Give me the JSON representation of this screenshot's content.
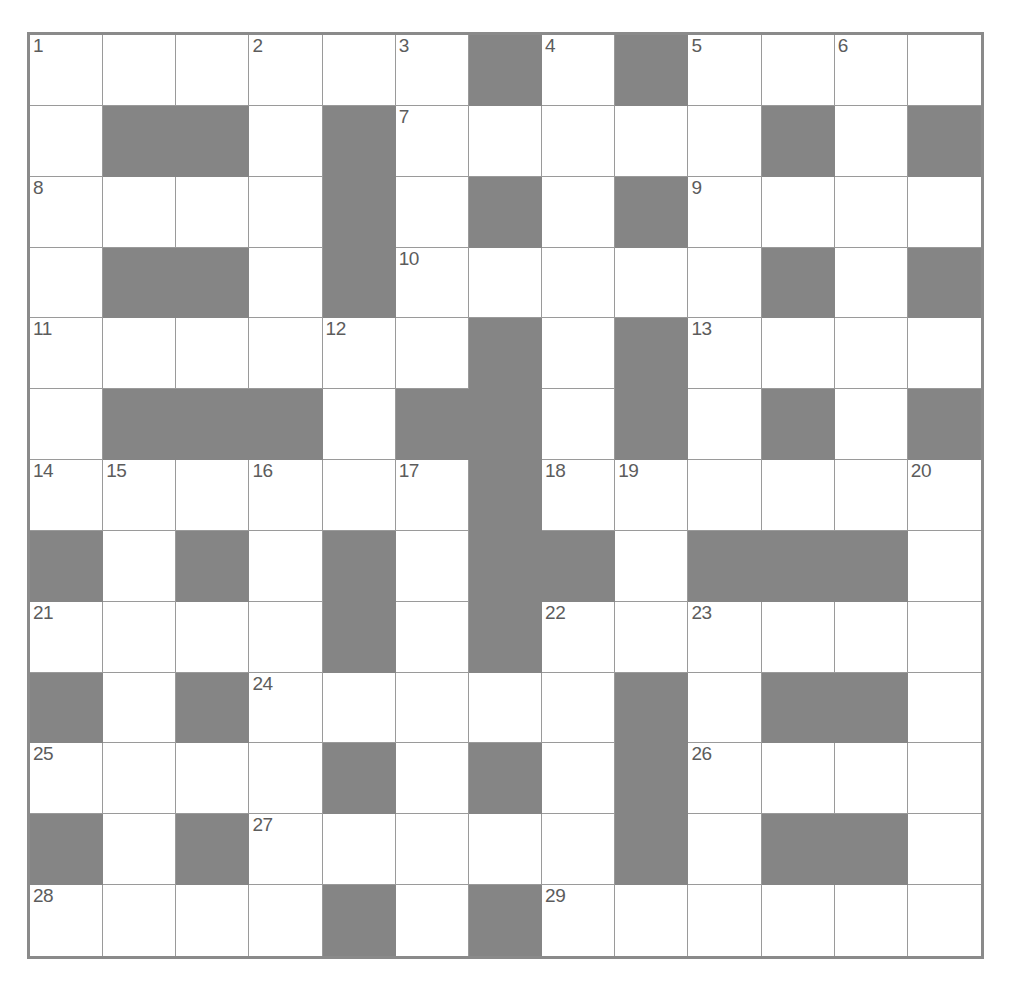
{
  "puzzle": {
    "type": "crossword-grid",
    "title": "Crossword puzzle grid",
    "rows": 13,
    "columns": 13,
    "colors": {
      "white_cell": "#ffffff",
      "black_cell": "#858585",
      "grid_line": "#9a9a9a",
      "outer_border": "#8a8a8a",
      "number_text": "#5c5c5c"
    },
    "legend": {
      "white": "open letter square",
      "black": "blocked square"
    },
    "clue_numbers_present": [
      1,
      2,
      3,
      4,
      5,
      6,
      7,
      8,
      9,
      10,
      11,
      12,
      13,
      14,
      15,
      16,
      17,
      18,
      19,
      20,
      21,
      22,
      23,
      24,
      25,
      26,
      27,
      28,
      29
    ],
    "clue_number_count": 29,
    "grid": [
      [
        {
          "state": "white",
          "number": "1"
        },
        {
          "state": "white",
          "number": ""
        },
        {
          "state": "white",
          "number": ""
        },
        {
          "state": "white",
          "number": "2"
        },
        {
          "state": "white",
          "number": ""
        },
        {
          "state": "white",
          "number": "3"
        },
        {
          "state": "black",
          "number": ""
        },
        {
          "state": "white",
          "number": "4"
        },
        {
          "state": "black",
          "number": ""
        },
        {
          "state": "white",
          "number": "5"
        },
        {
          "state": "white",
          "number": ""
        },
        {
          "state": "white",
          "number": "6"
        },
        {
          "state": "white",
          "number": ""
        }
      ],
      [
        {
          "state": "white",
          "number": ""
        },
        {
          "state": "black",
          "number": ""
        },
        {
          "state": "black",
          "number": ""
        },
        {
          "state": "white",
          "number": ""
        },
        {
          "state": "black",
          "number": ""
        },
        {
          "state": "white",
          "number": "7"
        },
        {
          "state": "white",
          "number": ""
        },
        {
          "state": "white",
          "number": ""
        },
        {
          "state": "white",
          "number": ""
        },
        {
          "state": "white",
          "number": ""
        },
        {
          "state": "black",
          "number": ""
        },
        {
          "state": "white",
          "number": ""
        },
        {
          "state": "black",
          "number": ""
        }
      ],
      [
        {
          "state": "white",
          "number": "8"
        },
        {
          "state": "white",
          "number": ""
        },
        {
          "state": "white",
          "number": ""
        },
        {
          "state": "white",
          "number": ""
        },
        {
          "state": "black",
          "number": ""
        },
        {
          "state": "white",
          "number": ""
        },
        {
          "state": "black",
          "number": ""
        },
        {
          "state": "white",
          "number": ""
        },
        {
          "state": "black",
          "number": ""
        },
        {
          "state": "white",
          "number": "9"
        },
        {
          "state": "white",
          "number": ""
        },
        {
          "state": "white",
          "number": ""
        },
        {
          "state": "white",
          "number": ""
        }
      ],
      [
        {
          "state": "white",
          "number": ""
        },
        {
          "state": "black",
          "number": ""
        },
        {
          "state": "black",
          "number": ""
        },
        {
          "state": "white",
          "number": ""
        },
        {
          "state": "black",
          "number": ""
        },
        {
          "state": "white",
          "number": "10"
        },
        {
          "state": "white",
          "number": ""
        },
        {
          "state": "white",
          "number": ""
        },
        {
          "state": "white",
          "number": ""
        },
        {
          "state": "white",
          "number": ""
        },
        {
          "state": "black",
          "number": ""
        },
        {
          "state": "white",
          "number": ""
        },
        {
          "state": "black",
          "number": ""
        }
      ],
      [
        {
          "state": "white",
          "number": "11"
        },
        {
          "state": "white",
          "number": ""
        },
        {
          "state": "white",
          "number": ""
        },
        {
          "state": "white",
          "number": ""
        },
        {
          "state": "white",
          "number": "12"
        },
        {
          "state": "white",
          "number": ""
        },
        {
          "state": "black",
          "number": ""
        },
        {
          "state": "white",
          "number": ""
        },
        {
          "state": "black",
          "number": ""
        },
        {
          "state": "white",
          "number": "13"
        },
        {
          "state": "white",
          "number": ""
        },
        {
          "state": "white",
          "number": ""
        },
        {
          "state": "white",
          "number": ""
        }
      ],
      [
        {
          "state": "white",
          "number": ""
        },
        {
          "state": "black",
          "number": ""
        },
        {
          "state": "black",
          "number": ""
        },
        {
          "state": "black",
          "number": ""
        },
        {
          "state": "white",
          "number": ""
        },
        {
          "state": "black",
          "number": ""
        },
        {
          "state": "black",
          "number": ""
        },
        {
          "state": "white",
          "number": ""
        },
        {
          "state": "black",
          "number": ""
        },
        {
          "state": "white",
          "number": ""
        },
        {
          "state": "black",
          "number": ""
        },
        {
          "state": "white",
          "number": ""
        },
        {
          "state": "black",
          "number": ""
        }
      ],
      [
        {
          "state": "white",
          "number": "14"
        },
        {
          "state": "white",
          "number": "15"
        },
        {
          "state": "white",
          "number": ""
        },
        {
          "state": "white",
          "number": "16"
        },
        {
          "state": "white",
          "number": ""
        },
        {
          "state": "white",
          "number": "17"
        },
        {
          "state": "black",
          "number": ""
        },
        {
          "state": "white",
          "number": "18"
        },
        {
          "state": "white",
          "number": "19"
        },
        {
          "state": "white",
          "number": ""
        },
        {
          "state": "white",
          "number": ""
        },
        {
          "state": "white",
          "number": ""
        },
        {
          "state": "white",
          "number": "20"
        }
      ],
      [
        {
          "state": "black",
          "number": ""
        },
        {
          "state": "white",
          "number": ""
        },
        {
          "state": "black",
          "number": ""
        },
        {
          "state": "white",
          "number": ""
        },
        {
          "state": "black",
          "number": ""
        },
        {
          "state": "white",
          "number": ""
        },
        {
          "state": "black",
          "number": ""
        },
        {
          "state": "black",
          "number": ""
        },
        {
          "state": "white",
          "number": ""
        },
        {
          "state": "black",
          "number": ""
        },
        {
          "state": "black",
          "number": ""
        },
        {
          "state": "black",
          "number": ""
        },
        {
          "state": "white",
          "number": ""
        }
      ],
      [
        {
          "state": "white",
          "number": "21"
        },
        {
          "state": "white",
          "number": ""
        },
        {
          "state": "white",
          "number": ""
        },
        {
          "state": "white",
          "number": ""
        },
        {
          "state": "black",
          "number": ""
        },
        {
          "state": "white",
          "number": ""
        },
        {
          "state": "black",
          "number": ""
        },
        {
          "state": "white",
          "number": "22"
        },
        {
          "state": "white",
          "number": ""
        },
        {
          "state": "white",
          "number": "23"
        },
        {
          "state": "white",
          "number": ""
        },
        {
          "state": "white",
          "number": ""
        },
        {
          "state": "white",
          "number": ""
        }
      ],
      [
        {
          "state": "black",
          "number": ""
        },
        {
          "state": "white",
          "number": ""
        },
        {
          "state": "black",
          "number": ""
        },
        {
          "state": "white",
          "number": "24"
        },
        {
          "state": "white",
          "number": ""
        },
        {
          "state": "white",
          "number": ""
        },
        {
          "state": "white",
          "number": ""
        },
        {
          "state": "white",
          "number": ""
        },
        {
          "state": "black",
          "number": ""
        },
        {
          "state": "white",
          "number": ""
        },
        {
          "state": "black",
          "number": ""
        },
        {
          "state": "black",
          "number": ""
        },
        {
          "state": "white",
          "number": ""
        }
      ],
      [
        {
          "state": "white",
          "number": "25"
        },
        {
          "state": "white",
          "number": ""
        },
        {
          "state": "white",
          "number": ""
        },
        {
          "state": "white",
          "number": ""
        },
        {
          "state": "black",
          "number": ""
        },
        {
          "state": "white",
          "number": ""
        },
        {
          "state": "black",
          "number": ""
        },
        {
          "state": "white",
          "number": ""
        },
        {
          "state": "black",
          "number": ""
        },
        {
          "state": "white",
          "number": "26"
        },
        {
          "state": "white",
          "number": ""
        },
        {
          "state": "white",
          "number": ""
        },
        {
          "state": "white",
          "number": ""
        }
      ],
      [
        {
          "state": "black",
          "number": ""
        },
        {
          "state": "white",
          "number": ""
        },
        {
          "state": "black",
          "number": ""
        },
        {
          "state": "white",
          "number": "27"
        },
        {
          "state": "white",
          "number": ""
        },
        {
          "state": "white",
          "number": ""
        },
        {
          "state": "white",
          "number": ""
        },
        {
          "state": "white",
          "number": ""
        },
        {
          "state": "black",
          "number": ""
        },
        {
          "state": "white",
          "number": ""
        },
        {
          "state": "black",
          "number": ""
        },
        {
          "state": "black",
          "number": ""
        },
        {
          "state": "white",
          "number": ""
        }
      ],
      [
        {
          "state": "white",
          "number": "28"
        },
        {
          "state": "white",
          "number": ""
        },
        {
          "state": "white",
          "number": ""
        },
        {
          "state": "white",
          "number": ""
        },
        {
          "state": "black",
          "number": ""
        },
        {
          "state": "white",
          "number": ""
        },
        {
          "state": "black",
          "number": ""
        },
        {
          "state": "white",
          "number": "29"
        },
        {
          "state": "white",
          "number": ""
        },
        {
          "state": "white",
          "number": ""
        },
        {
          "state": "white",
          "number": ""
        },
        {
          "state": "white",
          "number": ""
        },
        {
          "state": "white",
          "number": ""
        }
      ]
    ]
  }
}
